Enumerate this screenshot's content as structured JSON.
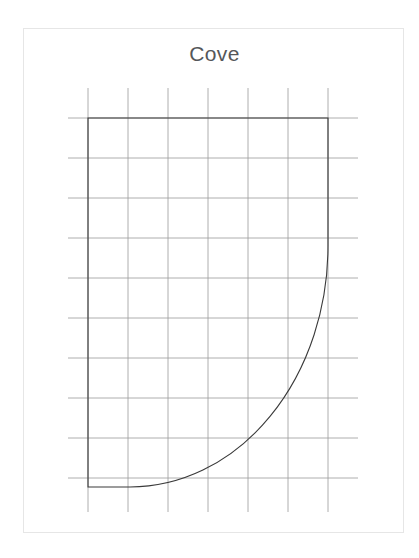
{
  "card": {
    "title": "Cove",
    "background_color": "#ffffff",
    "border_color": "#e6e6e6",
    "title_color": "#55575a"
  },
  "page": {
    "background_color": "#ffffff",
    "width": 419,
    "height": 558
  },
  "chart_data": {
    "type": "line",
    "title": "Cove",
    "subtitle": "",
    "xlabel": "",
    "ylabel": "",
    "grid": true,
    "grid_color": "#9a9a9a",
    "grid_spacing": 40,
    "legend": "none",
    "xlim": [
      68,
      358
    ],
    "ylim": [
      88,
      512
    ],
    "x_gridlines": [
      88,
      128,
      168,
      208,
      248,
      288,
      328
    ],
    "y_gridlines": [
      118,
      158,
      198,
      238,
      278,
      318,
      358,
      398,
      438,
      478
    ],
    "profile_name": "Cove",
    "stroke_color": "#3a3a3a",
    "stroke_width": 1.1,
    "outline_points": [
      {
        "x": 88,
        "y": 118,
        "label": "top-left"
      },
      {
        "x": 328,
        "y": 118,
        "label": "top-right"
      },
      {
        "x": 328,
        "y": 246,
        "label": "curve-start-right"
      },
      {
        "x": 130,
        "y": 487,
        "label": "curve-end-bottom"
      },
      {
        "x": 88,
        "y": 487,
        "label": "bottom-left"
      }
    ],
    "arc": {
      "type": "quarter-ellipse",
      "from_x": 328,
      "from_y": 246,
      "to_x": 130,
      "to_y": 487,
      "rx": 198,
      "ry": 241,
      "sweep": 0,
      "large_arc": 0,
      "center_x": 130,
      "center_y": 246
    },
    "path_d": "M 88 118 L 328 118 L 328 246 A 198 241 0 0 1 130 487 L 88 487 Z"
  }
}
